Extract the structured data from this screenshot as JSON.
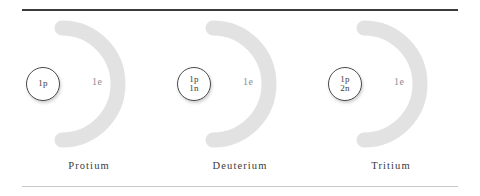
{
  "figure": {
    "rule_top_color": "#3a3a3c",
    "rule_bottom_color": "#c9c9cb",
    "shell_color": "#e2e2e2",
    "nucleus_border_color": "#4a4a4c",
    "electron_label_color": "#8e8e92",
    "caption_color": "#3a3a3c"
  },
  "isotopes": [
    {
      "caption": "Protium",
      "nucleus": [
        "1p"
      ],
      "electron_label": "1e",
      "shell_icon": "electron-shell-arc"
    },
    {
      "caption": "Deuterium",
      "nucleus": [
        "1p",
        "1n"
      ],
      "electron_label": "1e",
      "shell_icon": "electron-shell-arc"
    },
    {
      "caption": "Tritium",
      "nucleus": [
        "1p",
        "2n"
      ],
      "electron_label": "1e",
      "shell_icon": "electron-shell-arc"
    }
  ]
}
